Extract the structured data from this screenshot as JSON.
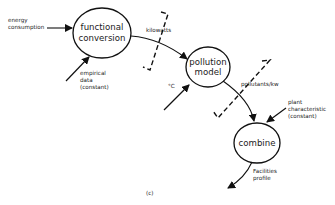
{
  "diagram": {
    "caption": "(c)",
    "nodes": [
      {
        "id": "functional-conversion",
        "lines": [
          "functional",
          "conversion"
        ]
      },
      {
        "id": "pollution-model",
        "lines": [
          "pollution",
          "model"
        ]
      },
      {
        "id": "combine",
        "lines": [
          "combine"
        ]
      }
    ],
    "inputs": {
      "energy_consumption": [
        "energy",
        "consumption"
      ],
      "empirical_data": [
        "empirical",
        "data",
        "(constant)"
      ],
      "temperature": "°C",
      "plant_characteristic": [
        "plant",
        "characteristic",
        "(constant)"
      ]
    },
    "flows": {
      "kilowatts": "kilowatts",
      "pollutants_per_kw": "pollutants/kw",
      "facilities_profile": [
        "Facilities",
        "profile"
      ]
    },
    "colors": {
      "stroke": "#111111",
      "text": "#222222",
      "background": "#ffffff"
    }
  }
}
